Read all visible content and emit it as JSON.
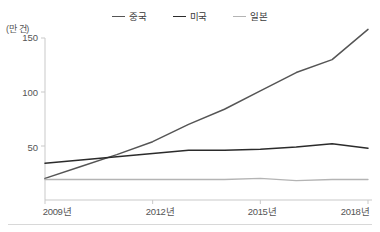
{
  "chart_data": {
    "type": "line",
    "title": "",
    "subtitle": "",
    "unit_label": "(만 건)",
    "xlabel": "",
    "ylabel": "",
    "x": [
      2009,
      2010,
      2011,
      2012,
      2013,
      2014,
      2015,
      2016,
      2017,
      2018
    ],
    "categories": [
      "2009년",
      "2010년",
      "2011년",
      "2012년",
      "2013년",
      "2014년",
      "2015년",
      "2016년",
      "2017년",
      "2018년"
    ],
    "xtick_labels": [
      "2009년",
      "2012년",
      "2015년",
      "2018년"
    ],
    "xtick_values": [
      2009,
      2012,
      2015,
      2018
    ],
    "ytick_labels": [
      "50",
      "100",
      "150"
    ],
    "ytick_values": [
      50,
      100,
      150
    ],
    "xlim": [
      2009,
      2018
    ],
    "ylim": [
      0,
      150
    ],
    "grid": false,
    "legend_position": "top-center",
    "series": [
      {
        "name": "중국",
        "color": "#555555",
        "values": [
          20,
          31,
          42,
          54,
          70,
          84,
          101,
          118,
          130,
          158
        ]
      },
      {
        "name": "미국",
        "color": "#2b2b2b",
        "values": [
          34,
          37,
          40,
          43,
          46,
          46,
          47,
          49,
          52,
          48
        ]
      },
      {
        "name": "일본",
        "color": "#b4b4b4",
        "values": [
          19,
          19,
          19,
          19,
          19,
          19,
          20,
          18,
          19,
          19
        ]
      }
    ]
  }
}
